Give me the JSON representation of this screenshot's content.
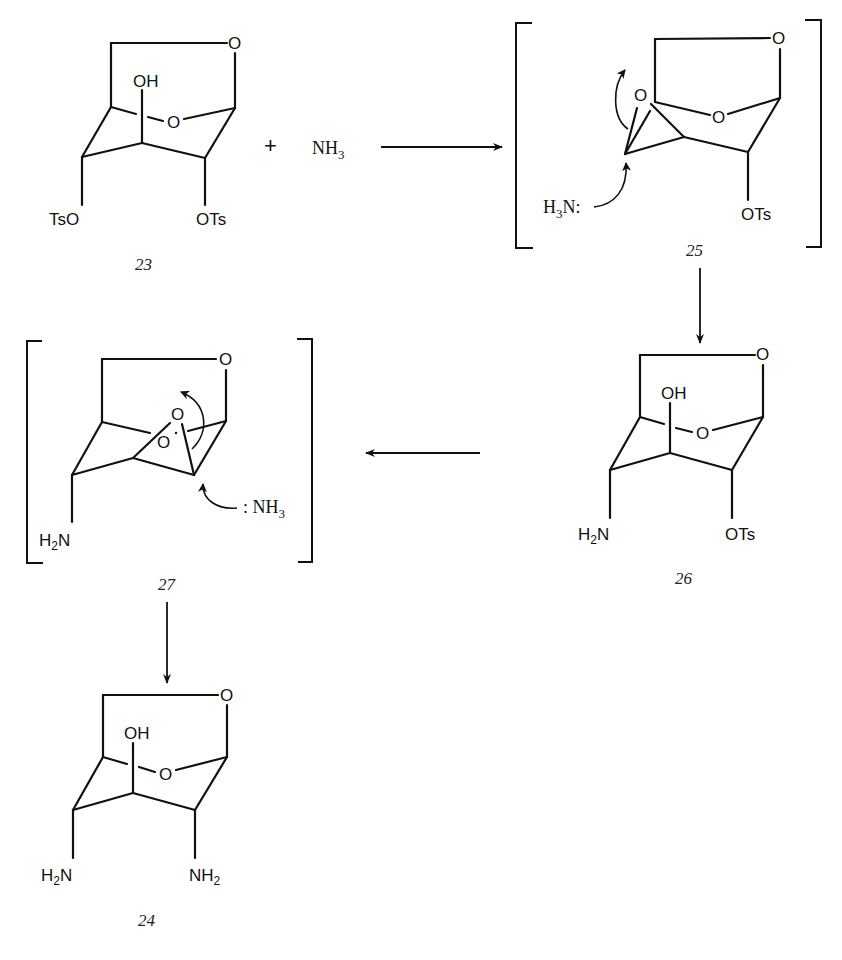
{
  "figure": {
    "type": "reaction-mechanism-scheme",
    "colors": {
      "ink": "#111111",
      "background": "#ffffff"
    }
  },
  "reagent": {
    "plus": "+",
    "name": "NH",
    "subscript": "3"
  },
  "compounds": {
    "c23": {
      "label": "23",
      "atoms": {
        "bridge_o": "O",
        "ring_o": "O",
        "oh": "OH",
        "left_sub": "TsO",
        "right_sub": "OTs"
      }
    },
    "c25": {
      "label": "25",
      "bracketed": true,
      "atoms": {
        "bridge_o": "O",
        "ring_o": "O",
        "epoxide_o": "O",
        "right_sub": "OTs"
      },
      "nucleophile": {
        "prefix": "H",
        "subscript": "3",
        "suffix": "N:"
      }
    },
    "c26": {
      "label": "26",
      "atoms": {
        "bridge_o": "O",
        "ring_o": "O",
        "oh": "OH",
        "left_sub_main": "H",
        "left_sub_sub": "2",
        "left_sub_tail": "N",
        "right_sub": "OTs"
      }
    },
    "c27": {
      "label": "27",
      "bracketed": true,
      "atoms": {
        "bridge_o": "O",
        "ring_o": "O",
        "epoxide_o": "O",
        "left_sub_main": "H",
        "left_sub_sub": "2",
        "left_sub_tail": "N"
      },
      "nucleophile": {
        "prefix": ": NH",
        "subscript": "3"
      }
    },
    "c24": {
      "label": "24",
      "atoms": {
        "bridge_o": "O",
        "ring_o": "O",
        "oh": "OH",
        "left_sub_main": "H",
        "left_sub_sub": "2",
        "left_sub_tail": "N",
        "right_sub_main": "NH",
        "right_sub_sub": "2"
      }
    }
  },
  "arrows": [
    {
      "from": "23 + NH3",
      "to": "25",
      "direction": "right"
    },
    {
      "from": "25",
      "to": "26",
      "direction": "down"
    },
    {
      "from": "26",
      "to": "27",
      "direction": "left"
    },
    {
      "from": "27",
      "to": "24",
      "direction": "down"
    }
  ]
}
